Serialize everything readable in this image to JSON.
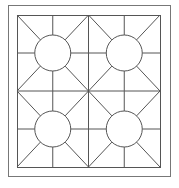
{
  "figure": {
    "stroke_color": "#555555",
    "border_color": "#777777",
    "background": "#ffffff",
    "outer_frame": {
      "x": 8,
      "y": 5,
      "w": 162,
      "h": 171
    },
    "inner_frame": {
      "x": 17,
      "y": 15,
      "w": 143,
      "h": 152
    },
    "quadrants": [
      {
        "name": "top-left",
        "cx": 53,
        "cy": 53,
        "r": 18
      },
      {
        "name": "top-right",
        "cx": 124,
        "cy": 53,
        "r": 18
      },
      {
        "name": "bottom-left",
        "cx": 53,
        "cy": 129,
        "r": 18
      },
      {
        "name": "bottom-right",
        "cx": 124,
        "cy": 129,
        "r": 18
      }
    ]
  }
}
